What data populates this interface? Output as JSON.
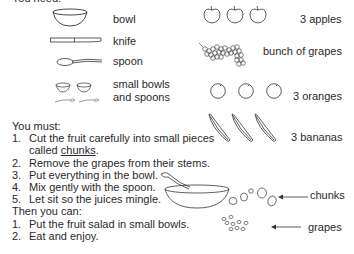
{
  "header": {
    "title": "You need:"
  },
  "equipment": [
    {
      "icon": "bowl",
      "label": "bowl"
    },
    {
      "icon": "knife",
      "label": "knife"
    },
    {
      "icon": "spoon",
      "label": "spoon"
    },
    {
      "icon": "small-bowls-and-spoons",
      "label_line1": "small bowls",
      "label_line2": "and spoons"
    }
  ],
  "ingredients": [
    {
      "icon": "apple",
      "count": 3,
      "label": "3 apples"
    },
    {
      "icon": "grapes",
      "count": 1,
      "label": "bunch of grapes"
    },
    {
      "icon": "orange",
      "count": 3,
      "label": "3 oranges"
    },
    {
      "icon": "banana",
      "count": 3,
      "label": "3 bananas"
    }
  ],
  "must": {
    "heading": "You must:",
    "steps": [
      {
        "num": "1.",
        "text_line1": "Cut the fruit carefully into small pieces",
        "text_line2_prefix": "called ",
        "text_line2_term": "chunks",
        "text_line2_suffix": "."
      },
      {
        "num": "2.",
        "text": "Remove the grapes from their stems."
      },
      {
        "num": "3.",
        "text": "Put everything in the bowl."
      },
      {
        "num": "4.",
        "text": "Mix gently with the spoon."
      },
      {
        "num": "5.",
        "text": "Let sit so the juices mingle."
      }
    ]
  },
  "then": {
    "heading": "Then you can:",
    "steps": [
      {
        "num": "1.",
        "text": "Put the fruit salad in small bowls."
      },
      {
        "num": "2.",
        "text": "Eat and enjoy."
      }
    ]
  },
  "callouts": {
    "chunks": "chunks",
    "grapes": "grapes"
  }
}
